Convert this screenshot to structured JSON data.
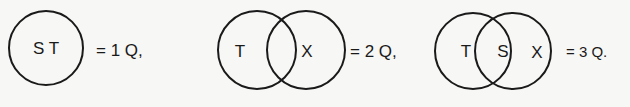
{
  "diagrams": [
    {
      "labels": [
        "S T"
      ],
      "equation": "= 1 Q,"
    },
    {
      "labels": [
        "T",
        "X"
      ],
      "equation": "= 2 Q,"
    },
    {
      "labels": [
        "T",
        "S",
        "X"
      ],
      "equation": "= 3 Q."
    }
  ],
  "colors": {
    "background": "#f7f7f5",
    "stroke": "#1a1a1a"
  }
}
